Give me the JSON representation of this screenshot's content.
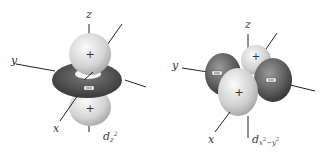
{
  "figure": {
    "type": "d-orbital diagrams",
    "panels": [
      {
        "id": "dz2",
        "orbital_label": {
          "base": "d",
          "sub": "z",
          "sup": "2"
        },
        "axes": {
          "x": "x",
          "y": "y",
          "z": "z"
        },
        "lobes": [
          {
            "position": "top",
            "sign": "+"
          },
          {
            "position": "bottom",
            "sign": "+"
          },
          {
            "position": "torus",
            "sign": "−"
          }
        ]
      },
      {
        "id": "dx2-y2",
        "orbital_label": {
          "base": "d",
          "sub": "x",
          "sub_sup": "2",
          "sub_rest": "−y",
          "sub_rest_sup": "2"
        },
        "axes": {
          "x": "x",
          "y": "y",
          "z": "z"
        },
        "lobes": [
          {
            "position": "back-x",
            "sign": "+"
          },
          {
            "position": "front-x",
            "sign": "+"
          },
          {
            "position": "left-y",
            "sign": "−"
          },
          {
            "position": "right-y",
            "sign": "−"
          }
        ]
      }
    ],
    "colors": {
      "positive_lobe_light": "#f2f2f2",
      "positive_lobe_dark": "#a8a8a8",
      "negative_lobe_light": "#8a8a8a",
      "negative_lobe_dark": "#2e2e2e",
      "axis": "#222222"
    }
  }
}
